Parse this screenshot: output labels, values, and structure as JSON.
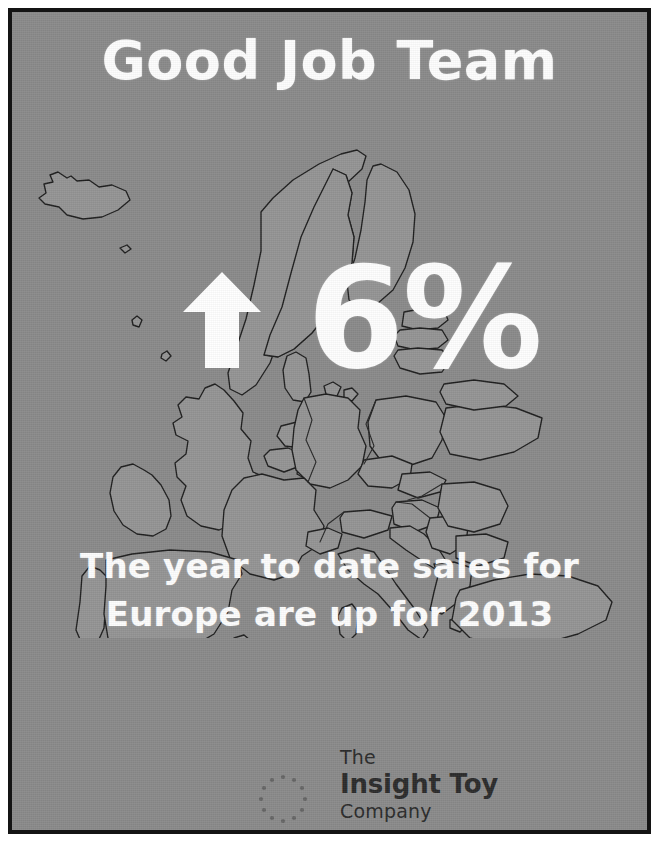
{
  "poster": {
    "background_color": "#8a8a8a",
    "frame_color": "#141414",
    "text_color": "#fdfdfd",
    "title": "Good Job Team",
    "percent_value": "6%",
    "arrow_direction": "up",
    "subtitle_line1": "The year to date sales for",
    "subtitle_line2": "Europe are up for 2013"
  },
  "map": {
    "region_name": "Europe",
    "land_fill": "#949494",
    "outline_color": "#1e1e1e"
  },
  "logo": {
    "line1": "The",
    "line2": "Insight Toy",
    "line3": "Company",
    "mark": "dotted-ring-icon",
    "text_color": "#2b2b2b"
  }
}
